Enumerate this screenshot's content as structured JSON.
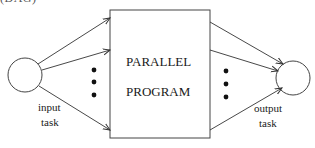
{
  "caption": {
    "text": "(DAG)",
    "visible_fragment": "(DAG)"
  },
  "diagram": {
    "box": {
      "line1": "PARALLEL",
      "line2": "PROGRAM"
    },
    "input_node": {
      "label_line1": "input",
      "label_line2": "task"
    },
    "output_node": {
      "label_line1": "output",
      "label_line2": "task"
    },
    "input_arrows_count": 3,
    "output_arrows_count": 3,
    "ellipsis": "• • •",
    "colors": {
      "stroke": "#333333",
      "text": "#1a1a1a",
      "background": "#ffffff"
    }
  }
}
